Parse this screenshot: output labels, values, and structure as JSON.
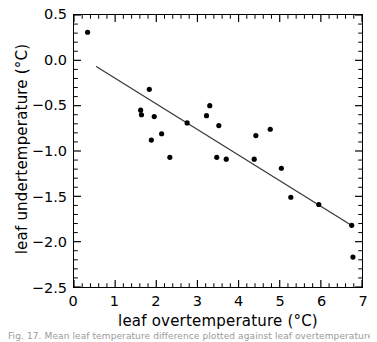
{
  "chart_data": {
    "type": "scatter",
    "title": "",
    "xlabel": "leaf  overtemperature  (°C)",
    "ylabel": "leaf  undertemperature  (°C)",
    "xlim": [
      0,
      7
    ],
    "ylim": [
      -2.5,
      0.5
    ],
    "xticks": [
      0,
      1,
      2,
      3,
      4,
      5,
      6,
      7
    ],
    "yticks": [
      0.5,
      0.0,
      -0.5,
      -1.0,
      -1.5,
      -2.0,
      -2.5
    ],
    "xtick_labels": [
      "0",
      "1",
      "2",
      "3",
      "4",
      "5",
      "6",
      "7"
    ],
    "ytick_labels": [
      "0.5",
      "0.0",
      "-0.5",
      "-1.0",
      "-1.5",
      "-2.0",
      "-2.5"
    ],
    "minor_ticks_per_interval": 5,
    "grid": false,
    "legend": null,
    "marker": "filled-circle",
    "marker_color": "#000000",
    "marker_size_px": 5.2,
    "series": [
      {
        "name": "leaf temperature observations",
        "points": [
          [
            0.33,
            0.31
          ],
          [
            1.62,
            -0.55
          ],
          [
            1.64,
            -0.6
          ],
          [
            1.83,
            -0.32
          ],
          [
            1.88,
            -0.88
          ],
          [
            1.95,
            -0.62
          ],
          [
            2.13,
            -0.81
          ],
          [
            2.33,
            -1.07
          ],
          [
            2.75,
            -0.69
          ],
          [
            3.22,
            -0.61
          ],
          [
            3.3,
            -0.5
          ],
          [
            3.47,
            -1.07
          ],
          [
            3.52,
            -0.72
          ],
          [
            3.7,
            -1.09
          ],
          [
            4.38,
            -1.09
          ],
          [
            4.42,
            -0.83
          ],
          [
            4.77,
            -0.76
          ],
          [
            5.04,
            -1.19
          ],
          [
            5.27,
            -1.51
          ],
          [
            5.95,
            -1.59
          ],
          [
            6.75,
            -1.82
          ],
          [
            6.78,
            -2.17
          ]
        ]
      }
    ],
    "trend_line": {
      "name": "linear regression fit",
      "color": "#3a3a3a",
      "width_px": 1.3,
      "x_start": 0.55,
      "y_start": -0.07,
      "x_end": 6.78,
      "y_end": -1.83,
      "slope": -0.2825,
      "intercept": 0.0854
    }
  },
  "caption": {
    "text": "Fig.  17.  Mean  leaf  temperature  difference  plotted  against  leaf  overtemperature,  for  all  measured"
  }
}
